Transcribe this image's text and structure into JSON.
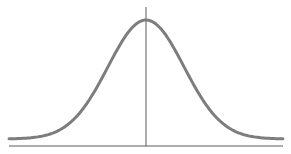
{
  "chart_data": {
    "type": "line",
    "title": "",
    "xlabel": "",
    "ylabel": "",
    "distribution": "normal",
    "mean": 0,
    "std_dev": 1,
    "xlim": [
      -3.6,
      3.6
    ],
    "ylim": [
      0,
      0.4
    ],
    "mean_line": {
      "x": 0
    },
    "grid": false,
    "legend": "none",
    "colors": {
      "curve": "#7d7d7d",
      "axis": "#5a5a5a"
    }
  }
}
